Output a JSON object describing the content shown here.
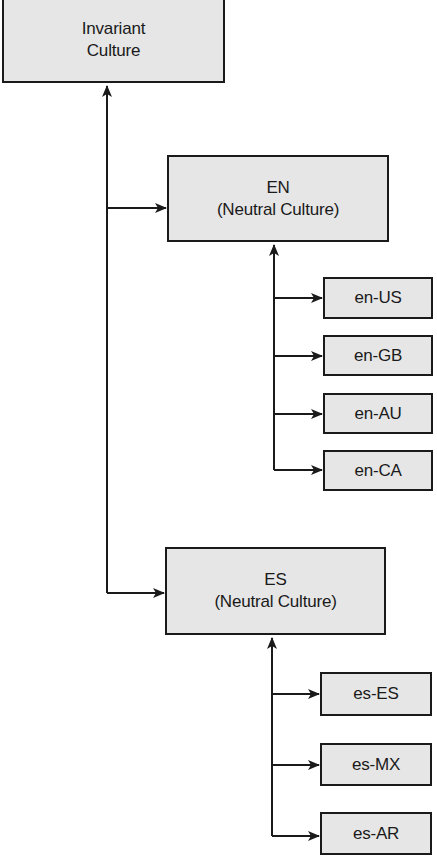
{
  "diagram": {
    "root": {
      "line1": "Invariant",
      "line2": "Culture"
    },
    "neutral": [
      {
        "code": "EN",
        "label": "(Neutral Culture)",
        "specific": [
          "en-US",
          "en-GB",
          "en-AU",
          "en-CA"
        ]
      },
      {
        "code": "ES",
        "label": "(Neutral Culture)",
        "specific": [
          "es-ES",
          "es-MX",
          "es-AR"
        ]
      }
    ]
  },
  "colors": {
    "box_fill": "#e6e6e6",
    "stroke": "#1a1a1a",
    "background": "#ffffff"
  }
}
